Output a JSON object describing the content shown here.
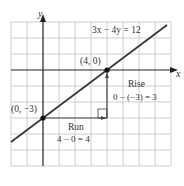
{
  "diagram": {
    "equation": "3x − 4y = 12",
    "axis_x_label": "x",
    "axis_y_label": "y",
    "point_x_intercept": "(4, 0)",
    "point_y_intercept": "(0, −3)",
    "rise_label": "Rise",
    "rise_calc": "0 − (−3) = 3",
    "run_label": "Run",
    "run_calc": "4 − 0 = 4",
    "colors": {
      "grid": "#cccccc",
      "axis": "#222222",
      "line": "#333333",
      "text": "#333333"
    }
  }
}
